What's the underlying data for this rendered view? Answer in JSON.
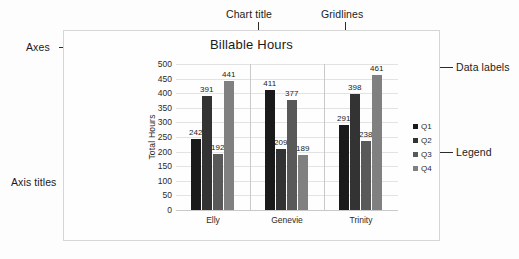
{
  "chart_data": {
    "type": "bar",
    "title": "Billable Hours",
    "xlabel": "Employee",
    "ylabel": "Total Hours",
    "categories": [
      "Elly",
      "Genevie",
      "Trinity"
    ],
    "series": [
      {
        "name": "Q1",
        "values": [
          242,
          411,
          291
        ],
        "color": "#1a1a1a"
      },
      {
        "name": "Q2",
        "values": [
          391,
          209,
          398
        ],
        "color": "#333333"
      },
      {
        "name": "Q3",
        "values": [
          192,
          377,
          238
        ],
        "color": "#595959"
      },
      {
        "name": "Q4",
        "values": [
          441,
          189,
          461
        ],
        "color": "#808080"
      }
    ],
    "ylim": [
      0,
      500
    ],
    "ytick_step": 50,
    "yticks": [
      "500",
      "450",
      "400",
      "350",
      "300",
      "250",
      "200",
      "150",
      "100",
      "50",
      "0"
    ],
    "grid": true,
    "legend_position": "right",
    "data_labels": true
  },
  "annotations": {
    "chart_title": "Chart title",
    "gridlines": "Gridlines",
    "axes": "Axes",
    "axis_titles": "Axis titles",
    "data_labels": "Data labels",
    "legend": "Legend"
  }
}
